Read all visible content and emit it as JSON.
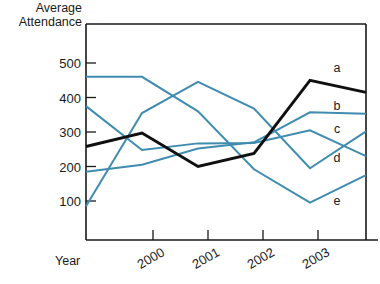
{
  "chart_data": {
    "type": "line",
    "title": "",
    "xlabel": "Year",
    "ylabel": "Average Attendance",
    "ylabel_line1": "Average",
    "ylabel_line2": "Attendance",
    "x": [
      "",
      "2000",
      "2001",
      "2002",
      "2003",
      ""
    ],
    "xtick_labels": [
      "2000",
      "2001",
      "2002",
      "2003"
    ],
    "ytick_labels": [
      "100",
      "200",
      "300",
      "400",
      "500"
    ],
    "ytick_values": [
      100,
      200,
      300,
      400,
      500
    ],
    "ylim": [
      0,
      560
    ],
    "grid": false,
    "legend_position": "right-inline",
    "colors": {
      "series_a": "#101010",
      "series_blue": "#3f8cb0",
      "axis": "#1a1a1a"
    },
    "series": [
      {
        "name": "a",
        "label": "a",
        "color": "#101010",
        "width": 2.9,
        "values": [
          258,
          297,
          200,
          238,
          450,
          415
        ]
      },
      {
        "name": "b",
        "label": "b",
        "color": "#3f8cb0",
        "width": 2.0,
        "values": [
          185,
          205,
          252,
          270,
          357,
          353
        ]
      },
      {
        "name": "c",
        "label": "c",
        "color": "#3f8cb0",
        "width": 2.0,
        "values": [
          85,
          355,
          445,
          368,
          195,
          302
        ]
      },
      {
        "name": "d",
        "label": "d",
        "color": "#3f8cb0",
        "width": 2.0,
        "values": [
          375,
          248,
          267,
          268,
          305,
          230
        ]
      },
      {
        "name": "e",
        "label": "e",
        "color": "#3f8cb0",
        "width": 2.0,
        "values": [
          460,
          460,
          360,
          192,
          95,
          175
        ]
      }
    ],
    "series_label_anchors": [
      {
        "label": "a",
        "x": 337,
        "y": 72
      },
      {
        "label": "b",
        "x": 337,
        "y": 110
      },
      {
        "label": "c",
        "x": 337,
        "y": 133
      },
      {
        "label": "d",
        "x": 337,
        "y": 162
      },
      {
        "label": "e",
        "x": 337,
        "y": 205
      }
    ]
  }
}
